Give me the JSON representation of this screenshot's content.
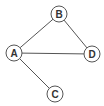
{
  "diagram": {
    "type": "undirected-graph",
    "colors": {
      "stroke": "#555555",
      "node_fill": "#ffffff",
      "label": "#333333",
      "background": "#ffffff"
    },
    "nodes": [
      {
        "id": "A",
        "label": "A",
        "x": 14,
        "y": 53
      },
      {
        "id": "B",
        "label": "B",
        "x": 59,
        "y": 14
      },
      {
        "id": "C",
        "label": "C",
        "x": 55,
        "y": 94
      },
      {
        "id": "D",
        "label": "D",
        "x": 92,
        "y": 54
      }
    ],
    "edges": [
      {
        "from": "A",
        "to": "B"
      },
      {
        "from": "B",
        "to": "D"
      },
      {
        "from": "A",
        "to": "D"
      },
      {
        "from": "A",
        "to": "C"
      }
    ],
    "node_radius": 8
  }
}
